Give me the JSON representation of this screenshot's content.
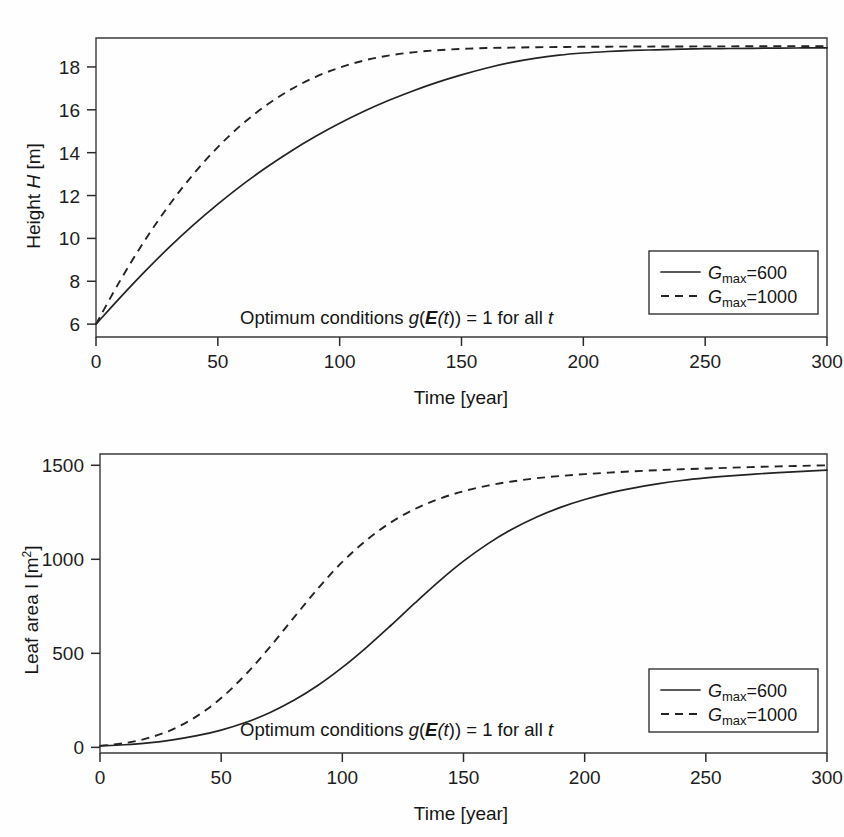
{
  "chart_data": [
    {
      "id": "height-vs-time",
      "type": "line",
      "title": "",
      "xlabel": "Time [year]",
      "ylabel": "Height H [m]",
      "ylabel_parts": {
        "pre": "Height ",
        "italic": "H",
        "post": " [m]"
      },
      "xlim": [
        0,
        300
      ],
      "ylim": [
        5.4,
        19.35
      ],
      "xticks": [
        0,
        50,
        100,
        150,
        200,
        250,
        300
      ],
      "xticklabels": [
        "0",
        "50",
        "100",
        "150",
        "200",
        "250",
        "300"
      ],
      "yticks": [
        6,
        8,
        10,
        12,
        14,
        16,
        18
      ],
      "yticklabels": [
        "6",
        "8",
        "10",
        "12",
        "14",
        "16",
        "18"
      ],
      "grid": false,
      "legend_position": "lower right",
      "annotation": "Optimum conditions g(E(t)) = 1 for all t",
      "x": [
        0,
        10,
        20,
        30,
        40,
        50,
        60,
        70,
        80,
        90,
        100,
        110,
        120,
        130,
        140,
        150,
        160,
        170,
        180,
        190,
        200,
        210,
        220,
        230,
        240,
        250,
        260,
        270,
        280,
        290,
        300
      ],
      "series": [
        {
          "name": "G_max = 600",
          "style": "solid",
          "values": [
            6.0,
            7.25,
            8.45,
            9.58,
            10.63,
            11.6,
            12.5,
            13.32,
            14.07,
            14.75,
            15.37,
            15.93,
            16.43,
            16.88,
            17.28,
            17.63,
            17.94,
            18.2,
            18.4,
            18.55,
            18.65,
            18.72,
            18.77,
            18.8,
            18.83,
            18.85,
            18.86,
            18.87,
            18.88,
            18.885,
            18.89
          ]
        },
        {
          "name": "G_max = 1000",
          "style": "dashed",
          "values": [
            6.0,
            8.05,
            9.9,
            11.55,
            13.0,
            14.26,
            15.33,
            16.22,
            16.95,
            17.53,
            17.97,
            18.3,
            18.53,
            18.68,
            18.78,
            18.84,
            18.88,
            18.9,
            18.92,
            18.93,
            18.94,
            18.945,
            18.95,
            18.95,
            18.955,
            18.96,
            18.96,
            18.965,
            18.97,
            18.97,
            18.97
          ]
        }
      ]
    },
    {
      "id": "leafarea-vs-time",
      "type": "line",
      "title": "",
      "xlabel": "Time [year]",
      "ylabel": "Leaf area I [m2]",
      "ylabel_parts": {
        "pre": "Leaf area I [m",
        "sup": "2",
        "post": "]"
      },
      "xlim": [
        0,
        300
      ],
      "ylim": [
        -30,
        1560
      ],
      "xticks": [
        0,
        50,
        100,
        150,
        200,
        250,
        300
      ],
      "xticklabels": [
        "0",
        "50",
        "100",
        "150",
        "200",
        "250",
        "300"
      ],
      "yticks": [
        0,
        500,
        1000,
        1500
      ],
      "yticklabels": [
        "0",
        "500",
        "1000",
        "1500"
      ],
      "grid": false,
      "legend_position": "lower right",
      "annotation": "Optimum conditions g(E(t)) = 1 for all t",
      "x": [
        0,
        10,
        20,
        30,
        40,
        50,
        60,
        70,
        80,
        90,
        100,
        110,
        120,
        130,
        140,
        150,
        160,
        170,
        180,
        190,
        200,
        210,
        220,
        230,
        240,
        250,
        260,
        270,
        280,
        290,
        300
      ],
      "series": [
        {
          "name": "G_max = 600",
          "style": "solid",
          "values": [
            8,
            14,
            24,
            40,
            62,
            92,
            132,
            184,
            250,
            330,
            425,
            532,
            648,
            768,
            884,
            990,
            1082,
            1160,
            1224,
            1276,
            1318,
            1352,
            1379,
            1401,
            1419,
            1433,
            1444,
            1453,
            1461,
            1468,
            1474
          ]
        },
        {
          "name": "G_max = 1000",
          "style": "dashed",
          "values": [
            8,
            22,
            50,
            96,
            166,
            262,
            386,
            532,
            690,
            846,
            986,
            1102,
            1196,
            1268,
            1322,
            1362,
            1392,
            1414,
            1431,
            1443,
            1453,
            1461,
            1468,
            1474,
            1479,
            1483,
            1487,
            1491,
            1494,
            1497,
            1500
          ]
        }
      ]
    }
  ],
  "legend": {
    "entries": [
      {
        "symbol": "G",
        "sub": "max",
        "eq": "=",
        "value": "600",
        "style": "solid"
      },
      {
        "symbol": "G",
        "sub": "max",
        "eq": "=",
        "value": "1000",
        "style": "dashed"
      }
    ]
  },
  "annotation_parts": {
    "pre": "Optimum conditions ",
    "g": "g",
    "paren_open": "(",
    "E": "E",
    "t1": "(t",
    "paren_close": ")) ",
    "eq": "= 1 for all ",
    "t2": "t"
  },
  "colors": {
    "background": "#fefefe",
    "axis": "#2b2b2b",
    "curve": "#232323",
    "text": "#161616",
    "legend_border": "#343434"
  }
}
